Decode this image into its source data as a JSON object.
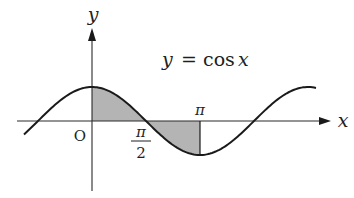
{
  "figure": {
    "equation_label": "y = cos x",
    "equation_parts": {
      "lhs": "y",
      "eq": "=",
      "fn": "cos",
      "arg": "x"
    },
    "x_axis_label": "x",
    "y_axis_label": "y",
    "origin_label": "O",
    "tick_labels": {
      "pi": "π",
      "pi_over_2_numerator": "π",
      "pi_over_2_denominator": "2"
    },
    "colors": {
      "curve": "#1a1a1a",
      "axis": "#2a2a2a",
      "shade": "#b4b4b4",
      "background": "#ffffff"
    }
  },
  "chart_data": {
    "type": "line",
    "title": "y = cos x",
    "xlabel": "x",
    "ylabel": "y",
    "function": "cos(x)",
    "x_range": [
      -2.0,
      6.5
    ],
    "y_range": [
      -1,
      1
    ],
    "marked_ticks": [
      {
        "x": 0,
        "label": "O"
      },
      {
        "x": 1.5708,
        "label": "π/2"
      },
      {
        "x": 3.1416,
        "label": "π"
      }
    ],
    "shaded_regions": [
      {
        "from": 0,
        "to": 1.5708,
        "between": "curve and x-axis",
        "sign": "positive"
      },
      {
        "from": 1.5708,
        "to": 3.1416,
        "between": "curve and x-axis",
        "sign": "negative"
      }
    ],
    "sample_points": [
      {
        "x": 0,
        "y": 1
      },
      {
        "x": 1.5708,
        "y": 0
      },
      {
        "x": 3.1416,
        "y": -1
      },
      {
        "x": 4.7124,
        "y": 0
      },
      {
        "x": 6.2832,
        "y": 1
      }
    ],
    "grid": false,
    "legend": "none"
  }
}
